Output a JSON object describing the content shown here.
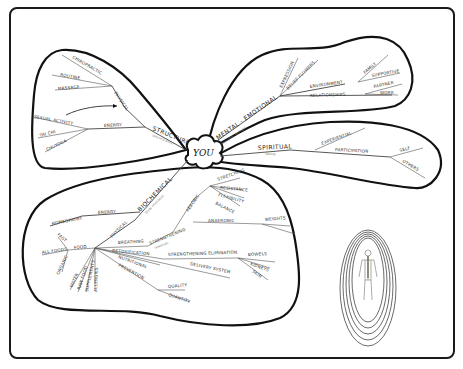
{
  "diagram": {
    "type": "mind-map",
    "center": "YOU",
    "branches": {
      "structure": {
        "label": "STRUCTURE",
        "sublabel": "(physical body)",
        "physical": {
          "label": "PHYSICAL",
          "children": [
            "CHIROPRACTIC",
            "ROUTINE",
            "MASSAGE"
          ]
        },
        "energy": {
          "label": "ENERGY",
          "children": [
            "SEXUAL ACTIVITY",
            "TAI CHI",
            "CHI/YOGA"
          ]
        }
      },
      "mental_emotional": {
        "label": "MENTAL - EMOTIONAL",
        "sublabel": "(thoughts, feelings)",
        "children": [
          "EXPRESSION",
          "BELIEF FLOWERS"
        ],
        "environment": {
          "label": "ENVIRONMENT",
          "children": [
            "FAMILY",
            "SUPPORTIVE"
          ]
        },
        "relationships": {
          "label": "RELATIONSHIPS",
          "children": [
            "PARTNER",
            "WORK"
          ]
        }
      },
      "spiritual": {
        "label": "SPIRITUAL",
        "sublabel": "(being)",
        "children": [
          "EXPERIENTIAL"
        ],
        "participation": {
          "label": "PARTICIPATION",
          "children": [
            "SELF",
            "OTHERS"
          ]
        }
      },
      "biochemical": {
        "label": "BIOCHEMICAL",
        "sublabel": "(body chemistry)",
        "energy": {
          "label": "ENERGY",
          "children": [
            "HOMEOPATHY"
          ]
        },
        "physical": {
          "label": "PHYSICAL",
          "food": {
            "label": "FOOD",
            "children": [
              "FAST",
              "ALL FOODS",
              "ORGANIC",
              "WATER",
              "RAW FOOD",
              "SUPPLEMENTS",
              "ALLERGIES"
            ]
          },
          "breathing": "BREATHING",
          "strengthening": {
            "label": "STRENGTHENING",
            "sublabel": "(exercise)",
            "children": [
              "AEROBIC",
              "STRETCHING",
              "RESISTANCE",
              "FLEXIBILITY",
              "BALANCE",
              "ANAEROBIC",
              "WEIGHTS"
            ]
          },
          "detoxification": "DETOXIFICATION",
          "strengthening_elimination": {
            "label": "STRENGTHENING ELIMINATION",
            "children": [
              "BOWELS",
              "KIDNEYS",
              "SKIN"
            ]
          },
          "delivery_system": "DELIVERY SYSTEM",
          "nutritional": "NUTRITIONAL",
          "prevention": {
            "label": "PREVENTION",
            "children": [
              "QUALITY",
              "QUANTITY"
            ]
          }
        }
      }
    },
    "illustration": "human-figure-nervous-system-with-concentric-aura-rings"
  }
}
